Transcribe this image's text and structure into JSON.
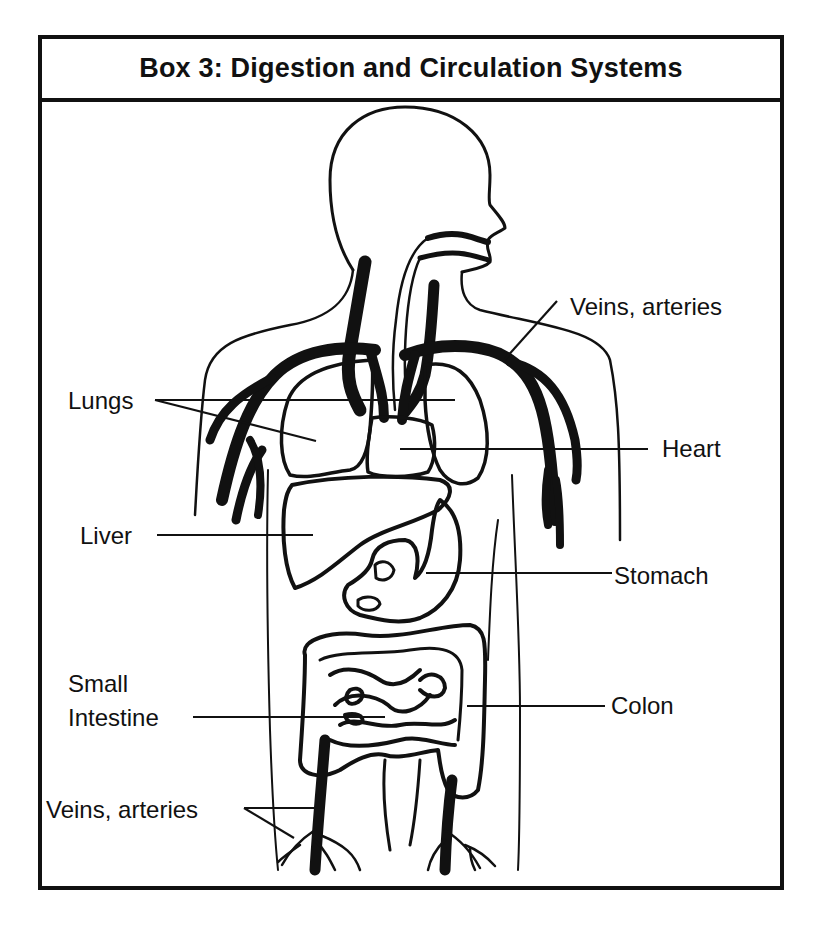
{
  "title": "Box 3: Digestion and Circulation Systems",
  "labels": {
    "veins_top": "Veins, arteries",
    "lungs": "Lungs",
    "heart": "Heart",
    "liver": "Liver",
    "stomach": "Stomach",
    "small": "Small",
    "intestine": "Intestine",
    "colon": "Colon",
    "veins_bottom": "Veins, arteries"
  },
  "colors": {
    "ink": "#111111",
    "background": "#ffffff"
  }
}
